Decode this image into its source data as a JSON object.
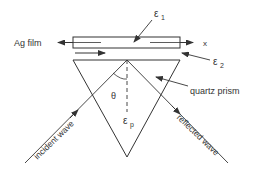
{
  "diagram": {
    "type": "optics-schematic",
    "labels": {
      "film": "Ag film",
      "axis_x": "x",
      "eps1_main": "ε",
      "eps1_sub": "1",
      "eps2_main": "ε",
      "eps2_sub": "2",
      "epsp_main": "ε",
      "epsp_sub": "p",
      "prism": "quartz prism",
      "theta": "θ",
      "incident": "incident wave",
      "reflected": "reflected wave"
    },
    "colors": {
      "line": "#333333",
      "background": "#ffffff"
    }
  }
}
